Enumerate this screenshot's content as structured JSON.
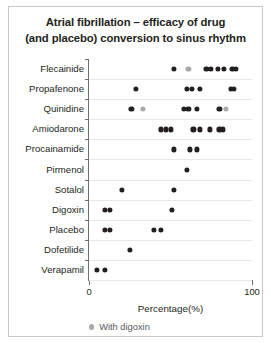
{
  "chart_data": {
    "type": "scatter",
    "title": "Atrial fibrillation – efficacy of drug (and placebo) conversion to sinus rhythm",
    "title_lines": [
      "Atrial fibrillation – efficacy of drug",
      "(and placebo) conversion to sinus rhythm"
    ],
    "xlabel": "Percentage(%)",
    "ylabel": "",
    "xlim": [
      0,
      100
    ],
    "xticks": [
      0,
      100
    ],
    "xticklabels": [
      "0",
      "100"
    ],
    "grid": true,
    "grid_axis": "y",
    "legend": {
      "position": "below-axis-left",
      "entries": [
        {
          "label": "With digoxin",
          "color": "#a7a9ac",
          "marker": "circle"
        }
      ]
    },
    "series_colors": {
      "plain": "#231f20",
      "with_digoxin": "#a7a9ac"
    },
    "categories": [
      "Flecainide",
      "Propafenone",
      "Quinidine",
      "Amiodarone",
      "Procainamide",
      "Pirmenol",
      "Sotalol",
      "Digoxin",
      "Placebo",
      "Dofetilide",
      "Verapamil"
    ],
    "points": [
      {
        "category": "Flecainide",
        "values": [
          52,
          72,
          75,
          79,
          83,
          88,
          90
        ],
        "digoxin_values": [
          61
        ]
      },
      {
        "category": "Propafenone",
        "values": [
          29,
          60,
          63,
          68,
          87,
          89
        ],
        "digoxin_values": []
      },
      {
        "category": "Quinidine",
        "values": [
          26,
          58,
          61,
          66,
          80
        ],
        "digoxin_values": [
          33,
          84
        ]
      },
      {
        "category": "Amiodarone",
        "values": [
          44,
          47,
          50,
          64,
          68,
          74,
          80,
          82
        ],
        "digoxin_values": []
      },
      {
        "category": "Procainamide",
        "values": [
          52,
          62,
          66
        ],
        "digoxin_values": []
      },
      {
        "category": "Pirmenol",
        "values": [
          60
        ],
        "digoxin_values": []
      },
      {
        "category": "Sotalol",
        "values": [
          20,
          52
        ],
        "digoxin_values": []
      },
      {
        "category": "Digoxin",
        "values": [
          10,
          13,
          51
        ],
        "digoxin_values": []
      },
      {
        "category": "Placebo",
        "values": [
          10,
          13,
          40,
          44
        ],
        "digoxin_values": []
      },
      {
        "category": "Dofetilide",
        "values": [
          25
        ],
        "digoxin_values": []
      },
      {
        "category": "Verapamil",
        "values": [
          5,
          10
        ],
        "digoxin_values": []
      }
    ]
  }
}
